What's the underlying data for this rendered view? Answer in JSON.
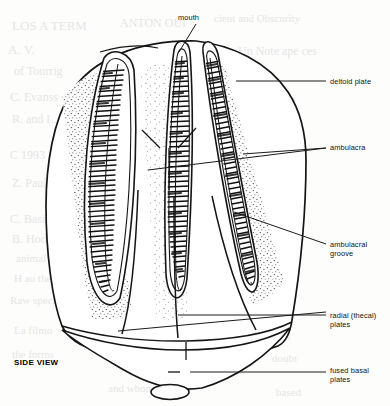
{
  "figure": {
    "view_label": "SIDE VIEW",
    "line_color": "#1a1a1a",
    "fill_color": "#ffffff",
    "stipple_color": "#2a2a2a",
    "background_color": "#fdfdfc"
  },
  "labels": [
    {
      "id": "mouth",
      "text": "mouth",
      "x": 178,
      "y": 13,
      "align": "left"
    },
    {
      "id": "deltoid",
      "text": "deltoid plate",
      "x": 330,
      "y": 77,
      "align": "left"
    },
    {
      "id": "ambulacra",
      "text": "ambulacra",
      "x": 330,
      "y": 143,
      "align": "left"
    },
    {
      "id": "groove",
      "text": "ambulacral\ngroove",
      "x": 330,
      "y": 240,
      "align": "left"
    },
    {
      "id": "radial",
      "text": "radial (thecal)\nplates",
      "x": 330,
      "y": 311,
      "align": "left"
    },
    {
      "id": "basal",
      "text": "fused basal\nplates",
      "x": 330,
      "y": 366,
      "align": "left"
    }
  ],
  "leaders": [
    {
      "id": "mouth-leader",
      "points": "196,24 179,52"
    },
    {
      "id": "deltoid-leader",
      "points": "236,81 326,81"
    },
    {
      "id": "ambulacra-leader-a",
      "points": "148,170 326,148"
    },
    {
      "id": "ambulacra-leader-b",
      "points": "243,154 326,148"
    },
    {
      "id": "groove-leader",
      "points": "234,212 326,244"
    },
    {
      "id": "radial-leader-a",
      "points": "178,315 326,315"
    },
    {
      "id": "radial-leader-b",
      "points": "118,331 326,312"
    },
    {
      "id": "basal-leader",
      "points": "190,372 326,372"
    }
  ],
  "anatomy": {
    "parts": [
      "theca-outline",
      "ambulacrum-left",
      "ambulacrum-center",
      "ambulacrum-right",
      "deltoid-plate-apex",
      "radial-plate-suture-left",
      "radial-plate-suture-center",
      "radial-plate-suture-right",
      "basal-plate-circlet",
      "stem-attachment-oval"
    ],
    "ambulacra_count": 3,
    "pore_rows_per_ambulacrum": 46
  },
  "bleedthrough": [
    {
      "text": "LOS A TERM",
      "x": 12,
      "y": 18,
      "size": 13
    },
    {
      "text": "ANTON OUI",
      "x": 120,
      "y": 16,
      "size": 12
    },
    {
      "text": "cient and Obscurity",
      "x": 214,
      "y": 12,
      "size": 11
    },
    {
      "text": "A. V.",
      "x": 8,
      "y": 42,
      "size": 13
    },
    {
      "text": "Un Note ape ces",
      "x": 238,
      "y": 44,
      "size": 12
    },
    {
      "text": "of Tourrig",
      "x": 14,
      "y": 64,
      "size": 12
    },
    {
      "text": "a genus",
      "x": 232,
      "y": 66,
      "size": 11
    },
    {
      "text": "C. Evanss",
      "x": 10,
      "y": 90,
      "size": 12
    },
    {
      "text": "the species",
      "x": 248,
      "y": 92,
      "size": 11
    },
    {
      "text": "R. and L.",
      "x": 12,
      "y": 112,
      "size": 12
    },
    {
      "text": "A Guy",
      "x": 258,
      "y": 120,
      "size": 11
    },
    {
      "text": "C 1993",
      "x": 10,
      "y": 148,
      "size": 12
    },
    {
      "text": "vs a the",
      "x": 254,
      "y": 150,
      "size": 11
    },
    {
      "text": "Z. Paul",
      "x": 12,
      "y": 176,
      "size": 12
    },
    {
      "text": "and",
      "x": 266,
      "y": 180,
      "size": 11
    },
    {
      "text": "C. Basic",
      "x": 10,
      "y": 212,
      "size": 12
    },
    {
      "text": "check, AC",
      "x": 252,
      "y": 210,
      "size": 11
    },
    {
      "text": "B. Hodge",
      "x": 12,
      "y": 232,
      "size": 12
    },
    {
      "text": "May Behr",
      "x": 250,
      "y": 234,
      "size": 11
    },
    {
      "text": "animal in",
      "x": 16,
      "y": 252,
      "size": 11
    },
    {
      "text": "H au the",
      "x": 14,
      "y": 272,
      "size": 11
    },
    {
      "text": "nature",
      "x": 268,
      "y": 276,
      "size": 11
    },
    {
      "text": "Raw species",
      "x": 10,
      "y": 294,
      "size": 11
    },
    {
      "text": "them",
      "x": 272,
      "y": 298,
      "size": 11
    },
    {
      "text": "La filmo",
      "x": 14,
      "y": 324,
      "size": 11
    },
    {
      "text": "has",
      "x": 276,
      "y": 330,
      "size": 11
    },
    {
      "text": "the forms",
      "x": 12,
      "y": 348,
      "size": 11
    },
    {
      "text": "doubt",
      "x": 272,
      "y": 352,
      "size": 11
    },
    {
      "text": "and whom",
      "x": 108,
      "y": 382,
      "size": 11
    },
    {
      "text": "based",
      "x": 276,
      "y": 386,
      "size": 11
    }
  ]
}
